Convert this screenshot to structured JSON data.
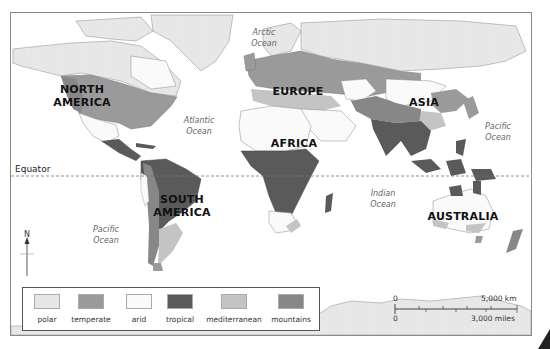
{
  "map": {
    "title": "World climate zones",
    "continents": [
      {
        "id": "north-america",
        "label": "NORTH AMERICA",
        "line1": "NORTH",
        "line2": "AMERICA"
      },
      {
        "id": "south-america",
        "label": "SOUTH AMERICA",
        "line1": "SOUTH",
        "line2": "AMERICA"
      },
      {
        "id": "europe",
        "label": "EUROPE"
      },
      {
        "id": "africa",
        "label": "AFRICA"
      },
      {
        "id": "asia",
        "label": "ASIA"
      },
      {
        "id": "australia",
        "label": "AUSTRALIA"
      }
    ],
    "oceans": [
      {
        "id": "arctic",
        "line1": "Arctic",
        "line2": "Ocean"
      },
      {
        "id": "atlantic",
        "line1": "Atlantic",
        "line2": "Ocean"
      },
      {
        "id": "pacific-east",
        "line1": "Pacific",
        "line2": "Ocean"
      },
      {
        "id": "pacific-south",
        "line1": "Pacific",
        "line2": "Ocean"
      },
      {
        "id": "indian",
        "line1": "Indian",
        "line2": "Ocean"
      }
    ],
    "equator_label": "Equator",
    "north_label": "N"
  },
  "legend": {
    "items": [
      {
        "label": "polar",
        "color": "#e6e6e6"
      },
      {
        "label": "temperate",
        "color": "#9a9a9a"
      },
      {
        "label": "arid",
        "color": "#fafafa"
      },
      {
        "label": "tropical",
        "color": "#5a5a5a"
      },
      {
        "label": "mediterranean",
        "color": "#c4c4c4"
      },
      {
        "label": "mountains",
        "color": "#878787"
      }
    ]
  },
  "scale": {
    "km_zero": "0",
    "km_label": "5,000 km",
    "mi_zero": "0",
    "mi_label": "3,000 miles"
  }
}
